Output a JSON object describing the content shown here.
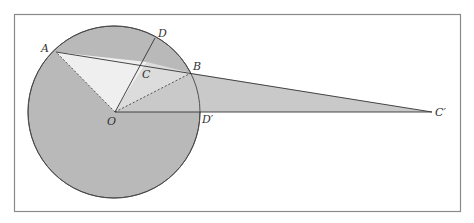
{
  "diagram": {
    "type": "geometry",
    "frame": {
      "x": 14,
      "y": 14,
      "width": 446,
      "height": 197,
      "stroke": "#8a8a8a"
    },
    "circle": {
      "cx": 114,
      "cy": 112,
      "r": 86,
      "fill": "#b9b9b9",
      "stroke": "#444444"
    },
    "colors": {
      "circle_fill": "#b9b9b9",
      "light_triangle": "#ececec",
      "mid_triangle": "#d6d6d6",
      "long_triangle": "#c4c4c4",
      "line": "#333333"
    },
    "points": {
      "A": {
        "x": 56,
        "y": 52,
        "label": "A"
      },
      "B": {
        "x": 191,
        "y": 73,
        "label": "B"
      },
      "C": {
        "x": 147,
        "y": 62,
        "label": "C"
      },
      "D": {
        "x": 155,
        "y": 38,
        "label": "D"
      },
      "O": {
        "x": 115,
        "y": 112,
        "label": "O"
      },
      "D_prime": {
        "x": 200,
        "y": 112,
        "label": "D′"
      },
      "C_prime": {
        "x": 432,
        "y": 112,
        "label": "C′"
      }
    },
    "segments": [
      {
        "from": "A",
        "to": "C_prime",
        "style": "solid"
      },
      {
        "from": "O",
        "to": "D",
        "style": "solid"
      },
      {
        "from": "O",
        "to": "C_prime",
        "style": "solid"
      },
      {
        "from": "O",
        "to": "A",
        "style": "dashed"
      },
      {
        "from": "O",
        "to": "B",
        "style": "dashed"
      }
    ]
  }
}
